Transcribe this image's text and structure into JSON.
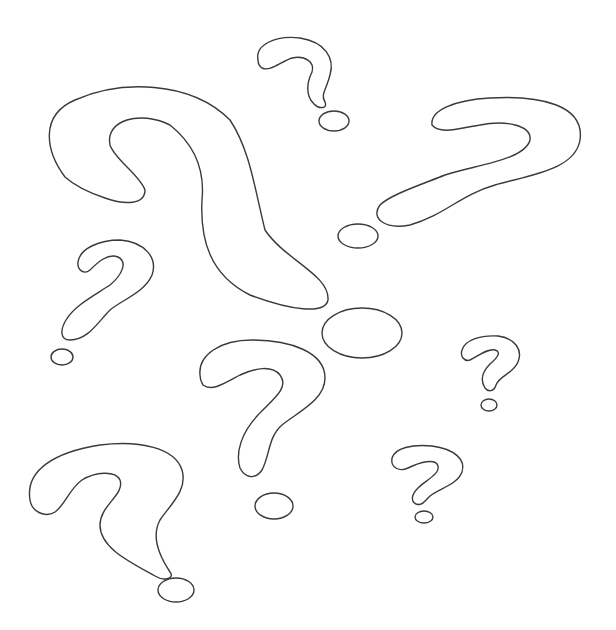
{
  "image": {
    "description": "Hand-drawn outline sketch of several question marks of varying sizes on white background",
    "colors": {
      "background": "#ffffff",
      "line": "#3a3a3a"
    },
    "question_marks": [
      {
        "id": "large-center",
        "label": "large question mark"
      },
      {
        "id": "top-small",
        "label": "small question mark (top)"
      },
      {
        "id": "right-large",
        "label": "question mark (right, tilted)"
      },
      {
        "id": "left-mid",
        "label": "question mark (left middle)"
      },
      {
        "id": "center-mid",
        "label": "question mark (center)"
      },
      {
        "id": "right-small",
        "label": "small question mark (right)"
      },
      {
        "id": "right-bottom-small",
        "label": "small question mark (bottom right)"
      },
      {
        "id": "bottom-left",
        "label": "question mark (bottom left)"
      }
    ]
  }
}
